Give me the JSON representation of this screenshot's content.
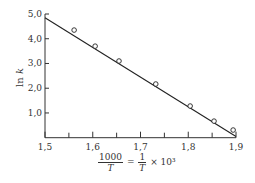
{
  "chart_data": {
    "type": "scatter",
    "title": "",
    "xlabel": "1000/T = (1/T) × 10^3",
    "ylabel": "ln k",
    "xlim": [
      1.5,
      1.9
    ],
    "ylim": [
      0,
      5.0
    ],
    "x_ticks": [
      "1,5",
      "1,6",
      "1,7",
      "1,8",
      "1,9"
    ],
    "x_minor_ticks": [
      1.55,
      1.65,
      1.75,
      1.85
    ],
    "y_ticks": [
      "1,0",
      "2,0",
      "3,0",
      "4,0",
      "5,0"
    ],
    "grid": false,
    "legend": null,
    "series": [
      {
        "name": "data points",
        "marker": "open-circle",
        "x": [
          1.561,
          1.605,
          1.655,
          1.732,
          1.804,
          1.854,
          1.894
        ],
        "y": [
          4.35,
          3.7,
          3.1,
          2.17,
          1.28,
          0.67,
          0.31
        ]
      },
      {
        "name": "fit line",
        "type": "line",
        "x": [
          1.5,
          1.9
        ],
        "y": [
          4.85,
          0.05
        ]
      }
    ]
  },
  "labels": {
    "ylabel_text": "ln ",
    "ylabel_var": "k",
    "xlabel_num": "1000",
    "xlabel_den": "T",
    "xlabel_eq": "=",
    "xlabel_num2": "1",
    "xlabel_den2": "T",
    "xlabel_tail": "× 10³"
  }
}
